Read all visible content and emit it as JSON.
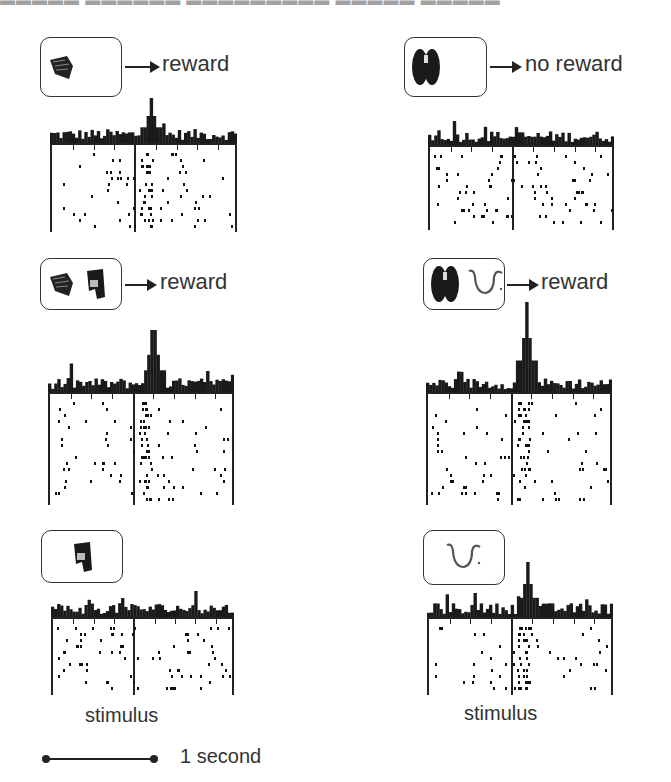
{
  "figure": {
    "title_clipped": "▬▬▬▬▬  ▬▬▬▬▬▬ ▬▬▬▬▬▬▬▬▬ ▬▬▬▬▬ ▬▬▬▬▬",
    "stimulus_label": "stimulus",
    "scale_bar_label": "1 second"
  },
  "panels": [
    {
      "id": "p1",
      "stimuli": [
        "leaf-cluster-icon"
      ],
      "outcome": "reward",
      "has_arrow": true
    },
    {
      "id": "p2",
      "stimuli": [
        "dark-blob-icon"
      ],
      "outcome": "no reward",
      "has_arrow": true
    },
    {
      "id": "p3",
      "stimuli": [
        "leaf-cluster-icon",
        "figure-icon"
      ],
      "outcome": "reward",
      "has_arrow": true
    },
    {
      "id": "p4",
      "stimuli": [
        "dark-blob-icon",
        "squiggle-icon"
      ],
      "outcome": "reward",
      "has_arrow": true
    },
    {
      "id": "p5",
      "stimuli": [
        "figure-icon"
      ],
      "outcome": "",
      "has_arrow": false
    },
    {
      "id": "p6",
      "stimuli": [
        "squiggle-icon"
      ],
      "outcome": "",
      "has_arrow": false
    }
  ],
  "colors": {
    "ink": "#222222",
    "text": "#333333",
    "background": "#ffffff"
  }
}
